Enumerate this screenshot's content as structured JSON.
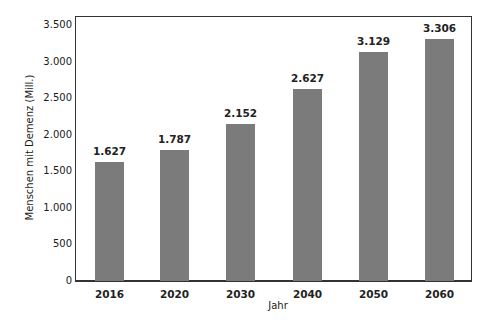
{
  "chart_data": {
    "type": "bar",
    "title": "",
    "xlabel": "Jahr",
    "ylabel": "Menschen mit Demenz (Mill.)",
    "categories": [
      "2016",
      "2020",
      "2030",
      "2040",
      "2050",
      "2060"
    ],
    "values": [
      1627,
      1787,
      2152,
      2627,
      3129,
      3306
    ],
    "value_labels": [
      "1.627",
      "1.787",
      "2.152",
      "2.627",
      "3.129",
      "3.306"
    ],
    "ylim": [
      0,
      3500
    ],
    "yticks": [
      0,
      500,
      1000,
      1500,
      2000,
      2500,
      3000,
      3500
    ],
    "ytick_labels": [
      "0",
      "500",
      "1.000",
      "1.500",
      "2.000",
      "2.500",
      "3.000",
      "3.500"
    ],
    "grid": false,
    "legend": null,
    "bar_color": "#7b7b7b"
  }
}
